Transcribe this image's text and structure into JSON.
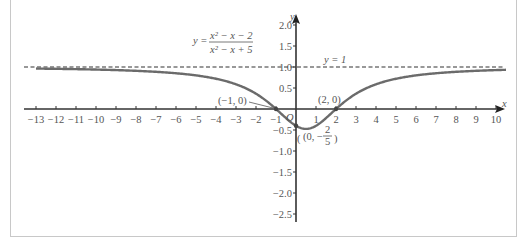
{
  "chart_data": {
    "type": "line",
    "title": "",
    "equation": {
      "lhs": "y =",
      "numerator": "x² − x − 2",
      "denominator": "x² − x + 5"
    },
    "xlabel": "x",
    "ylabel": "y",
    "xlim": [
      -13,
      10.5
    ],
    "ylim": [
      -2.6,
      2.2
    ],
    "grid": false,
    "x_ticks": [
      -13,
      -12,
      -11,
      -10,
      -9,
      -8,
      -7,
      -6,
      -5,
      -4,
      -3,
      -2,
      -1,
      1,
      2,
      3,
      4,
      5,
      6,
      7,
      8,
      9,
      10
    ],
    "x_tick_labels": [
      "−13",
      "−12",
      "−11",
      "−10",
      "−9",
      "−8",
      "−7",
      "−6",
      "−5",
      "−4",
      "−3",
      "−2",
      "−1",
      "1",
      "2",
      "3",
      "4",
      "5",
      "6",
      "7",
      "8",
      "9",
      "10"
    ],
    "y_ticks": [
      2.0,
      1.5,
      1.0,
      0.5,
      -0.5,
      -1.0,
      -1.5,
      -2.0,
      -2.5
    ],
    "y_tick_labels": [
      "2.0",
      "1.5",
      "1.0",
      "0.5",
      "−0.5",
      "−1.0",
      "−1.5",
      "−2.0",
      "−2.5"
    ],
    "origin_label": "O",
    "series": [
      {
        "name": "y = (x² − x − 2)/(x² − x + 5)",
        "function": "(x*x - x - 2)/(x*x - x + 5)",
        "x_range": [
          -13,
          10.5
        ],
        "color": "#6b6b6b",
        "sample_points": [
          [
            -13,
            0.9048
          ],
          [
            -10,
            0.8545
          ],
          [
            -8,
            0.8052
          ],
          [
            -6,
            0.7234
          ],
          [
            -4,
            0.72
          ],
          [
            -3,
            0.5882
          ],
          [
            -2,
            0.3636
          ],
          [
            -1,
            0.0
          ],
          [
            0,
            -0.4
          ],
          [
            0.5,
            -0.4737
          ],
          [
            1,
            -0.4
          ],
          [
            2,
            0.0
          ],
          [
            3,
            0.3636
          ],
          [
            4,
            0.5882
          ],
          [
            5,
            0.72
          ],
          [
            6,
            0.7714
          ],
          [
            8,
            0.8525
          ],
          [
            10,
            0.9107
          ]
        ]
      },
      {
        "name": "y = 1",
        "type": "asymptote",
        "value": 1,
        "style": "dashed",
        "color": "#333333"
      }
    ],
    "annotations": [
      {
        "text": "y = 1",
        "x": 2.9,
        "y": 1.1
      },
      {
        "text": "(−1, 0)",
        "point": [
          -1,
          0
        ]
      },
      {
        "text": "(2, 0)",
        "point": [
          2,
          0
        ]
      },
      {
        "text": "(0, −2/5)",
        "point": [
          0,
          -0.4
        ]
      }
    ]
  },
  "labels": {
    "eq_lhs": "y =",
    "eq_num": "x² − x − 2",
    "eq_den": "x² − x + 5",
    "asymptote": "y = 1",
    "pt_neg1": "(−1, 0)",
    "pt_2": "(2, 0)",
    "pt_min_open": "(0, −",
    "pt_min_num": "2",
    "pt_min_den": "5",
    "pt_min_close": ")",
    "origin": "O",
    "x_axis": "x",
    "y_axis": "y"
  }
}
